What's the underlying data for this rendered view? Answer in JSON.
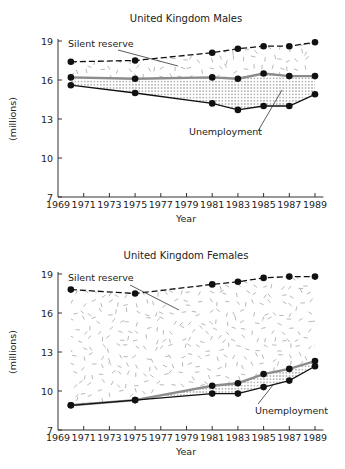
{
  "chart_data": [
    {
      "type": "line",
      "title": "United Kingdom Males",
      "xlabel": "Year",
      "ylabel": "(millions)",
      "xticks": [
        1969,
        1971,
        1973,
        1975,
        1977,
        1979,
        1981,
        1983,
        1985,
        1987,
        1989
      ],
      "xtick_labels": [
        "1969",
        "1971",
        "1973",
        "1975",
        "1977",
        "1979",
        "1981",
        "1983",
        "1985",
        "1987",
        "1989"
      ],
      "yticks": [
        7,
        10,
        13,
        16,
        19
      ],
      "ytick_labels": [
        "7",
        "10",
        "13",
        "16",
        "19"
      ],
      "xlim": [
        1969,
        1989.5
      ],
      "ylim": [
        7,
        19
      ],
      "grid": false,
      "x": [
        1970,
        1975,
        1981,
        1983,
        1985,
        1987,
        1989
      ],
      "series": [
        {
          "name": "Potential labour force (incl. silent reserve)",
          "style": "dashed",
          "color": "#111111",
          "values": [
            17.4,
            17.5,
            18.1,
            18.4,
            18.6,
            18.6,
            18.9
          ]
        },
        {
          "name": "Labour force",
          "style": "solid-grey",
          "color": "#8c8c8c",
          "values": [
            16.2,
            16.1,
            16.2,
            16.1,
            16.5,
            16.3,
            16.3
          ]
        },
        {
          "name": "Employment",
          "style": "solid",
          "color": "#111111",
          "values": [
            15.6,
            15.0,
            14.2,
            13.7,
            14.0,
            14.0,
            14.9
          ]
        }
      ],
      "fills": [
        {
          "name": "Silent reserve",
          "between": [
            "Potential labour force (incl. silent reserve)",
            "Labour force"
          ],
          "pattern": "dashes"
        },
        {
          "name": "Unemployment",
          "between": [
            "Labour force",
            "Employment"
          ],
          "pattern": "dots"
        }
      ],
      "annotations": [
        {
          "text": "Silent reserve",
          "x": 1970,
          "y": 18.7
        },
        {
          "text": "Unemployment",
          "x": 1980.8,
          "y": 12.2
        }
      ]
    },
    {
      "type": "line",
      "title": "United Kingdom Females",
      "xlabel": "Year",
      "ylabel": "(millions)",
      "xticks": [
        1969,
        1971,
        1973,
        1975,
        1977,
        1979,
        1981,
        1983,
        1985,
        1987,
        1989
      ],
      "xtick_labels": [
        "1969",
        "1971",
        "1973",
        "1975",
        "1977",
        "1979",
        "1981",
        "1983",
        "1985",
        "1987",
        "1989"
      ],
      "yticks": [
        7,
        10,
        13,
        16,
        19
      ],
      "ytick_labels": [
        "7",
        "10",
        "13",
        "16",
        "19"
      ],
      "xlim": [
        1969,
        1989.5
      ],
      "ylim": [
        7,
        19
      ],
      "grid": false,
      "x": [
        1970,
        1975,
        1981,
        1983,
        1985,
        1987,
        1989
      ],
      "series": [
        {
          "name": "Potential labour force (incl. silent reserve)",
          "style": "dashed",
          "color": "#111111",
          "values": [
            17.8,
            17.5,
            18.2,
            18.4,
            18.7,
            18.8,
            18.8
          ]
        },
        {
          "name": "Labour force",
          "style": "solid-grey",
          "color": "#8c8c8c",
          "values": [
            8.9,
            9.3,
            10.4,
            10.6,
            11.3,
            11.7,
            12.3
          ]
        },
        {
          "name": "Employment",
          "style": "solid",
          "color": "#111111",
          "values": [
            8.9,
            9.3,
            9.8,
            9.8,
            10.3,
            10.8,
            11.9
          ]
        }
      ],
      "fills": [
        {
          "name": "Silent reserve",
          "between": [
            "Potential labour force (incl. silent reserve)",
            "Labour force"
          ],
          "pattern": "dashes"
        },
        {
          "name": "Unemployment",
          "between": [
            "Labour force",
            "Employment"
          ],
          "pattern": "dots"
        }
      ],
      "annotations": [
        {
          "text": "Silent reserve",
          "x": 1970,
          "y": 18.7
        },
        {
          "text": "Unemployment",
          "x": 1984.5,
          "y": 8.6
        }
      ]
    }
  ],
  "figure": {
    "panels": [
      {
        "title": "United Kingdom Males",
        "silent_label": "Silent reserve",
        "unemp_label": "Unemployment",
        "xlabel": "Year",
        "ylabel": "(millions)"
      },
      {
        "title": "United Kingdom Females",
        "silent_label": "Silent reserve",
        "unemp_label": "Unemployment",
        "xlabel": "Year",
        "ylabel": "(millions)"
      }
    ]
  }
}
